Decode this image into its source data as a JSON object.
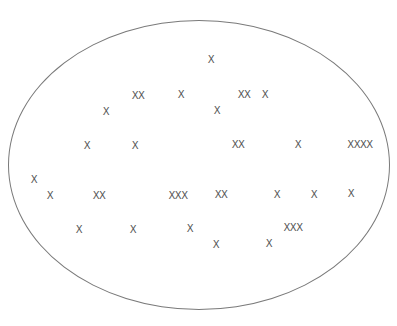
{
  "diagram": {
    "shape": "ellipse",
    "stroke_color": "#7a7a7a",
    "mark_color": "#555555",
    "marks": [
      {
        "text": "X",
        "x": 211,
        "y": 60
      },
      {
        "text": "XX",
        "x": 138,
        "y": 96
      },
      {
        "text": "X",
        "x": 181,
        "y": 95
      },
      {
        "text": "XX",
        "x": 244,
        "y": 95
      },
      {
        "text": "X",
        "x": 265,
        "y": 95
      },
      {
        "text": "X",
        "x": 106,
        "y": 112
      },
      {
        "text": "X",
        "x": 217,
        "y": 111
      },
      {
        "text": "X",
        "x": 87,
        "y": 146
      },
      {
        "text": "X",
        "x": 135,
        "y": 146
      },
      {
        "text": "XX",
        "x": 238,
        "y": 145
      },
      {
        "text": "X",
        "x": 298,
        "y": 145
      },
      {
        "text": "XXXX",
        "x": 360,
        "y": 145
      },
      {
        "text": "X",
        "x": 34,
        "y": 180
      },
      {
        "text": "X",
        "x": 50,
        "y": 196
      },
      {
        "text": "XX",
        "x": 99,
        "y": 196
      },
      {
        "text": "XXX",
        "x": 178,
        "y": 196
      },
      {
        "text": "XX",
        "x": 221,
        "y": 195
      },
      {
        "text": "X",
        "x": 277,
        "y": 195
      },
      {
        "text": "X",
        "x": 314,
        "y": 195
      },
      {
        "text": "X",
        "x": 351,
        "y": 194
      },
      {
        "text": "XXX",
        "x": 293,
        "y": 228
      },
      {
        "text": "X",
        "x": 79,
        "y": 230
      },
      {
        "text": "X",
        "x": 133,
        "y": 230
      },
      {
        "text": "X",
        "x": 190,
        "y": 229
      },
      {
        "text": "X",
        "x": 216,
        "y": 245
      },
      {
        "text": "X",
        "x": 269,
        "y": 244
      }
    ]
  }
}
